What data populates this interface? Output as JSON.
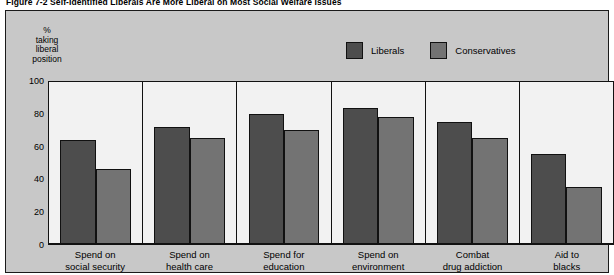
{
  "figure": {
    "title": "Figure 7-2  Self-Identified Liberals Are More Liberal on Most Social Welfare Issues"
  },
  "legend": {
    "entries": [
      {
        "label": "Liberals",
        "color": "#4d4d4d"
      },
      {
        "label": "Conservatives",
        "color": "#737373"
      }
    ]
  },
  "axis": {
    "y_caption_lines": [
      "%",
      "taking",
      "liberal",
      "position"
    ],
    "y_ticks": [
      "100",
      "80",
      "60",
      "40",
      "20",
      "0"
    ]
  },
  "chart_data": {
    "type": "bar",
    "title": "Figure 7-2  Self-Identified Liberals Are More Liberal on Most Social Welfare Issues",
    "xlabel": "",
    "ylabel": "% taking liberal position",
    "ylim": [
      0,
      100
    ],
    "yticks": [
      0,
      20,
      40,
      60,
      80,
      100
    ],
    "grid": false,
    "legend_position": "top-right",
    "categories": [
      "Spend on social security",
      "Spend on health care",
      "Spend for education",
      "Spend on environment",
      "Combat drug addiction",
      "Aid to blacks"
    ],
    "category_lines": [
      [
        "Spend on",
        "social security"
      ],
      [
        "Spend on",
        "health care"
      ],
      [
        "Spend for",
        "education"
      ],
      [
        "Spend on",
        "environment"
      ],
      [
        "Combat",
        "drug addiction"
      ],
      [
        "Aid to",
        "blacks"
      ]
    ],
    "series": [
      {
        "name": "Liberals",
        "color": "#4d4d4d",
        "values": [
          64,
          72,
          80,
          84,
          75,
          55
        ]
      },
      {
        "name": "Conservatives",
        "color": "#737373",
        "values": [
          46,
          65,
          70,
          78,
          65,
          35
        ]
      }
    ]
  }
}
